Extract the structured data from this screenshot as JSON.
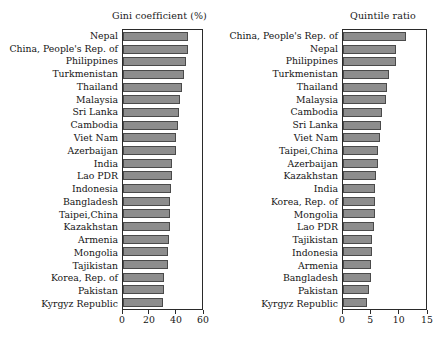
{
  "figure": {
    "background": "#ffffff",
    "bar_color": "#8d8d8d",
    "bar_edge_color": "#4a4a4a",
    "axis_color": "#2a2a2a"
  },
  "chart_data": [
    {
      "type": "bar",
      "orientation": "horizontal",
      "title": "Gini coefficient (%)",
      "xlabel": "",
      "ylabel": "",
      "xlim": [
        0,
        60
      ],
      "xticks": [
        0,
        20,
        40,
        60
      ],
      "xticklabels": [
        "0",
        "20",
        "40",
        "60"
      ],
      "grid": false,
      "legend": false,
      "categories": [
        "Nepal",
        "China, People's Rep. of",
        "Philippines",
        "Turkmenistan",
        "Thailand",
        "Malaysia",
        "Sri Lanka",
        "Cambodia",
        "Viet Nam",
        "Azerbaijan",
        "India",
        "Lao PDR",
        "Indonesia",
        "Bangladesh",
        "Taipei,China",
        "Kazakhstan",
        "Armenia",
        "Mongolia",
        "Tajikistan",
        "Korea, Rep. of",
        "Pakistan",
        "Kyrgyz Republic"
      ],
      "values": [
        49.5,
        49.5,
        48.0,
        46.5,
        45.0,
        43.5,
        42.5,
        41.8,
        40.5,
        40.0,
        37.5,
        37.0,
        36.5,
        36.0,
        35.8,
        35.5,
        35.0,
        34.5,
        34.0,
        31.5,
        31.0,
        30.5
      ]
    },
    {
      "type": "bar",
      "orientation": "horizontal",
      "title": "Quintile ratio",
      "xlabel": "",
      "ylabel": "",
      "xlim": [
        0,
        15
      ],
      "xticks": [
        0,
        5,
        10,
        15
      ],
      "xticklabels": [
        "0",
        "5",
        "10",
        "15"
      ],
      "grid": false,
      "legend": false,
      "categories": [
        "China, People's Rep. of",
        "Nepal",
        "Philippines",
        "Turkmenistan",
        "Thailand",
        "Malaysia",
        "Cambodia",
        "Sri Lanka",
        "Viet Nam",
        "Taipei,China",
        "Azerbaijan",
        "Kazakhstan",
        "India",
        "Korea, Rep. of",
        "Mongolia",
        "Lao PDR",
        "Tajikistan",
        "Indonesia",
        "Armenia",
        "Bangladesh",
        "Pakistan",
        "Kyrgyz Republic"
      ],
      "values": [
        11.4,
        9.6,
        9.5,
        8.3,
        7.9,
        7.8,
        7.0,
        6.9,
        6.6,
        6.4,
        6.3,
        5.9,
        5.8,
        5.7,
        5.7,
        5.6,
        5.3,
        5.2,
        5.1,
        5.1,
        4.7,
        4.4
      ]
    }
  ]
}
